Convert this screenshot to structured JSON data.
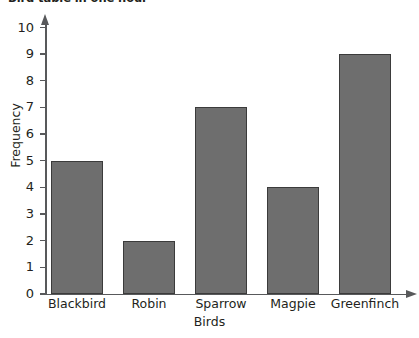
{
  "chart_data": {
    "type": "bar",
    "title": "Bird table in one hour",
    "xlabel": "Birds",
    "ylabel": "Frequency",
    "categories": [
      "Blackbird",
      "Robin",
      "Sparrow",
      "Magpie",
      "Greenfinch"
    ],
    "values": [
      5,
      2,
      7,
      4,
      9
    ],
    "ylim": [
      0,
      10
    ],
    "ytick_labels": [
      "0",
      "1",
      "2",
      "3",
      "4",
      "5",
      "6",
      "7",
      "8",
      "9",
      "10"
    ],
    "ytick_values": [
      0,
      1,
      2,
      3,
      4,
      5,
      6,
      7,
      8,
      9,
      10
    ],
    "grid": false,
    "legend": false,
    "bar_fill_color": "#6e6e6e",
    "bar_border_color": "#3b3b3b",
    "axis_color": "#58595b",
    "text_color": "#231f20",
    "background_color": "#ffffff"
  }
}
